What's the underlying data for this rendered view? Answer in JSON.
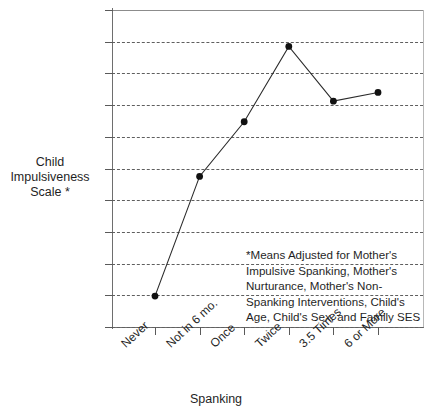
{
  "chart_data": {
    "type": "line",
    "title": "",
    "xlabel": "Spanking",
    "ylabel": "Child Impulsiveness Scale *",
    "categories": [
      "Never",
      "Not in 6 mo.",
      "Once",
      "Twice",
      "3.5 Times",
      "6 or More"
    ],
    "values": [
      41.95,
      49.5,
      52.95,
      57.7,
      54.25,
      54.8
    ],
    "ylim": [
      40,
      60
    ],
    "ytick_labels": [
      "60",
      "58",
      "56",
      "54",
      "52",
      "50",
      "48",
      "46",
      "44",
      "42",
      "40"
    ],
    "ytick_values": [
      60,
      58,
      56,
      54,
      52,
      50,
      48,
      46,
      44,
      42,
      40
    ],
    "grid": true,
    "legend": "none",
    "series_color": "#2b2b2b",
    "marker_color": "#111111",
    "annotation_lines": [
      "*Means Adjusted for Mother's",
      "Impulsive Spanking, Mother's",
      "Nurturance, Mother's Non-",
      "Spanking Interventions, Child's",
      "Age, Child's Sex, and Family SES"
    ]
  },
  "axis": {
    "y_title_line1": "Child",
    "y_title_line2": "Impulsiveness",
    "y_title_line3": "Scale *",
    "x_title": "Spanking"
  }
}
